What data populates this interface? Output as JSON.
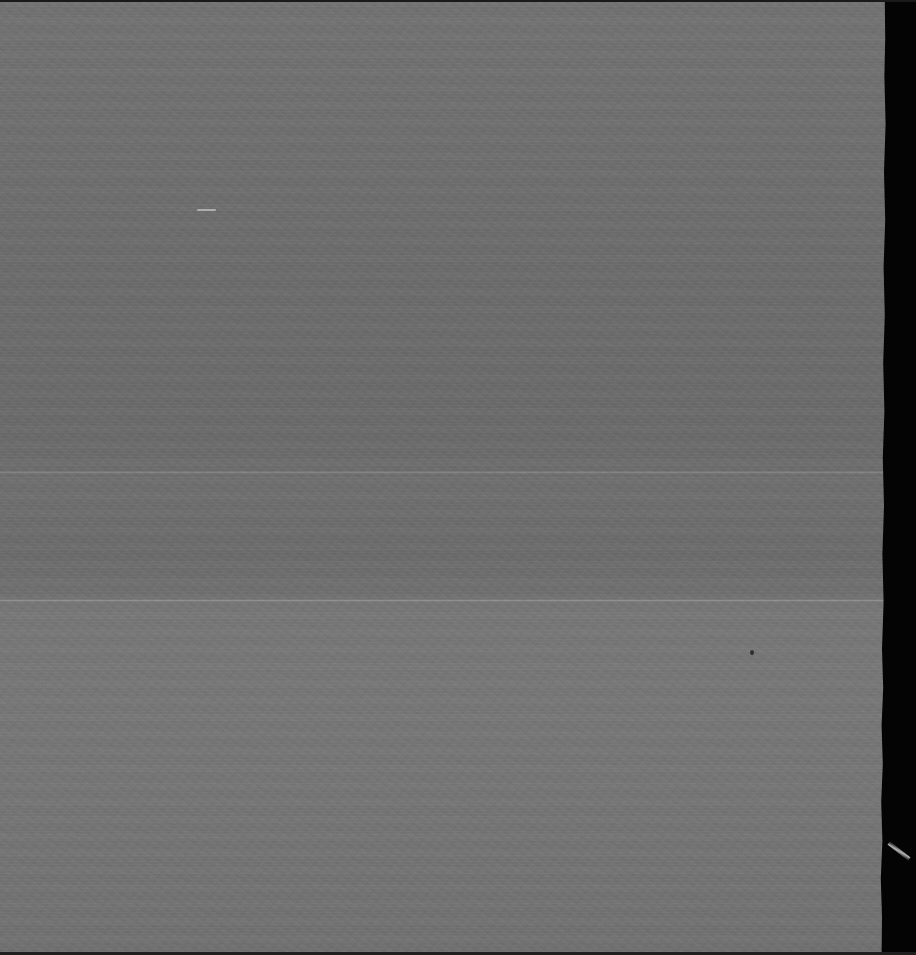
{
  "image": {
    "kind": "blank-gray-scan-frame",
    "description": "Near-uniform mid-gray scanned film frame with fine grain, horizontal scan banding, a dark irregular right-hand film margin, and a few small point and scratch artifacts. No user-interface elements, text, icons or chart content are present.",
    "width": 916,
    "height": 955,
    "background_color": "#000000"
  },
  "regions": [
    {
      "name": "upper-gray-field",
      "color": "#6e6e6e",
      "x": 0,
      "y": 0,
      "width": 893,
      "height": 600
    },
    {
      "name": "lower-gray-field",
      "color": "#737373",
      "x": 0,
      "y": 600,
      "width": 888,
      "height": 355
    }
  ],
  "margins": [
    {
      "name": "right-film-margin",
      "color": "#040404",
      "x": 876,
      "y": 0,
      "width": 40,
      "height": 955
    },
    {
      "name": "top-edge",
      "color": "#1a1a1a",
      "x": 0,
      "y": 0,
      "width": 916,
      "height": 2
    },
    {
      "name": "bottom-edge",
      "color": "#1f1f1f",
      "x": 0,
      "y": 952,
      "width": 916,
      "height": 3
    }
  ],
  "seams": [
    {
      "name": "seam-upper",
      "y": 471,
      "height": 3,
      "color": "#8a8a8a"
    },
    {
      "name": "seam-lower",
      "y": 599,
      "height": 3,
      "color": "#808080"
    }
  ],
  "artifacts": [
    {
      "name": "light-dash-artifact",
      "shape": "dash",
      "x": 197,
      "y": 209,
      "width": 19,
      "height": 2,
      "color": "#e1e1e1"
    },
    {
      "name": "dark-speck-artifact",
      "shape": "dot",
      "x": 750,
      "y": 650,
      "width": 4,
      "height": 5,
      "color": "#141414"
    },
    {
      "name": "diagonal-scratch-artifact",
      "shape": "streak",
      "x": 886,
      "y": 849,
      "width": 26,
      "height": 4,
      "rotation_deg": 38,
      "color": "#ebebeb"
    }
  ],
  "texture": {
    "grain": "fine film grain",
    "banding": "horizontal scan-line striping",
    "scanline_period_px": 3,
    "band_period_px": 17
  }
}
